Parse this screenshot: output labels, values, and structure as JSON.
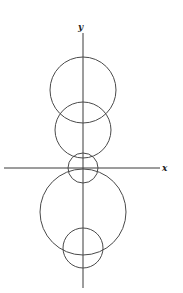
{
  "diagram": {
    "type": "coordinate-circles",
    "axes": {
      "x_label": "x",
      "y_label": "y",
      "origin": [
        83,
        168
      ],
      "x_axis": {
        "x1": 4,
        "x2": 160,
        "y": 168
      },
      "y_axis": {
        "x": 83,
        "y1": 33,
        "y2": 288
      }
    },
    "circles": [
      {
        "name": "circle-top",
        "cx": 83,
        "cy": 90,
        "r": 33
      },
      {
        "name": "circle-upper-middle",
        "cx": 83,
        "cy": 130,
        "r": 28
      },
      {
        "name": "circle-origin-small",
        "cx": 83,
        "cy": 168,
        "r": 15
      },
      {
        "name": "circle-large-lower",
        "cx": 83,
        "cy": 212,
        "r": 43
      },
      {
        "name": "circle-bottom",
        "cx": 83,
        "cy": 248,
        "r": 20
      }
    ],
    "colors": {
      "stroke": "#4a4a4a",
      "axis": "#3a3a3a",
      "background": "#ffffff"
    }
  }
}
